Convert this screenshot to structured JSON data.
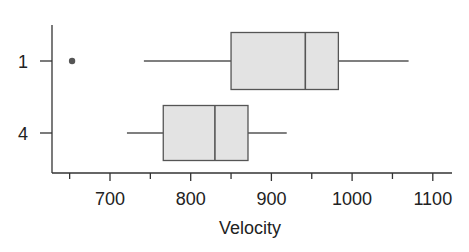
{
  "chart_data": {
    "type": "boxplot",
    "orientation": "horizontal",
    "title": "",
    "xlabel": "Velocity",
    "ylabel": "",
    "xlim": [
      650,
      1120
    ],
    "x_ticks": [
      700,
      800,
      900,
      1000,
      1100
    ],
    "x_tick_labels": [
      "700",
      "800",
      "900",
      "1000",
      "1100"
    ],
    "categories": [
      "1",
      "4"
    ],
    "series": [
      {
        "name": "1",
        "whisker_low": 742,
        "q1": 850,
        "median": 942,
        "q3": 983,
        "whisker_high": 1070,
        "outliers": [
          653
        ]
      },
      {
        "name": "4",
        "whisker_low": 721,
        "q1": 766,
        "median": 830,
        "q3": 871,
        "whisker_high": 919,
        "outliers": []
      }
    ],
    "grid": false,
    "legend": null,
    "colors": {
      "box_fill": "#e3e3e3",
      "stroke": "#555555"
    }
  }
}
